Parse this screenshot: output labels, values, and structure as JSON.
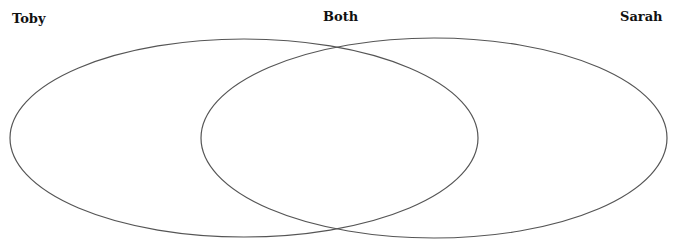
{
  "diagram": {
    "type": "venn",
    "labels": {
      "left": "Toby",
      "middle": "Both",
      "right": "Sarah"
    },
    "circles": [
      {
        "name": "Toby",
        "cx": 244,
        "cy": 138,
        "rx": 234,
        "ry": 99
      },
      {
        "name": "Sarah",
        "cx": 434,
        "cy": 138,
        "rx": 233,
        "ry": 100
      }
    ],
    "stroke_color": "#555555"
  }
}
